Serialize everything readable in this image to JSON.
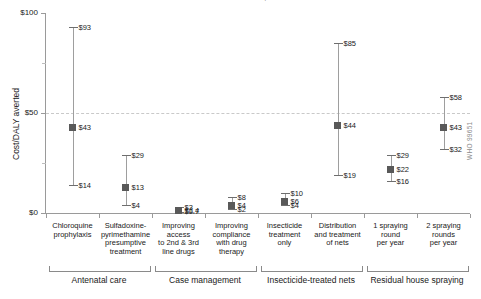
{
  "chart_data": {
    "type": "scatter",
    "title": "Cost-effectiveness of malaria interventions, sub-Saharan Africa",
    "xlabel": "",
    "ylabel": "Cost/DALY averted",
    "ylim": [
      0,
      100
    ],
    "ytick_labels": [
      "$100",
      "$50",
      "$0"
    ],
    "ytick_values": [
      100,
      50,
      0
    ],
    "yminor_values": [
      75,
      25
    ],
    "threshold": {
      "value": 50,
      "style": "dashed"
    },
    "grid": false,
    "legend": "none",
    "source": "WHO 99651",
    "value_prefix": "$",
    "categories": [
      "Chloroquine prophylaxis",
      "Sulfadoxine-pyrimethamine presumptive treatment",
      "Improving access to 2nd & 3rd line drugs",
      "Improving compliance with drug therapy",
      "Insecticide treatment only",
      "Distribution and treatment of nets",
      "1 spraying round per year",
      "2 spraying rounds per year"
    ],
    "category_lines": [
      [
        "Chloroquine",
        "prophylaxis"
      ],
      [
        "Sulfadoxine-",
        "pyrimethamine",
        "presumptive",
        "treatment"
      ],
      [
        "Improving",
        "access",
        "to 2nd & 3rd",
        "line drugs"
      ],
      [
        "Improving",
        "compliance",
        "with drug",
        "therapy"
      ],
      [
        "Insecticide",
        "treatment",
        "only"
      ],
      [
        "Distribution",
        "and treatment",
        "of nets"
      ],
      [
        "1 spraying",
        "round",
        "per year"
      ],
      [
        "2 spraying",
        "rounds",
        "per year"
      ]
    ],
    "points": [
      {
        "category": "Chloroquine prophylaxis",
        "high": 93,
        "value": 43,
        "low": 14,
        "high_label": "$93",
        "value_label": "$43",
        "low_label": "$14"
      },
      {
        "category": "Sulfadoxine-pyrimethamine presumptive treatment",
        "high": 29,
        "value": 13,
        "low": 4,
        "high_label": "$29",
        "value_label": "$13",
        "low_label": "$4"
      },
      {
        "category": "Improving access to 2nd & 3rd line drugs",
        "high": 3,
        "value": 1.4,
        "low": 0.7,
        "high_label": "$3",
        "value_label": "$1.4",
        "low_label": "$0.7"
      },
      {
        "category": "Improving compliance with drug therapy",
        "high": 8,
        "value": 4,
        "low": 2,
        "high_label": "$8",
        "value_label": "$4",
        "low_label": "$2"
      },
      {
        "category": "Insecticide treatment only",
        "high": 10,
        "value": 6,
        "low": 4,
        "high_label": "$10",
        "value_label": "$6",
        "low_label": "$4"
      },
      {
        "category": "Distribution and treatment of nets",
        "high": 85,
        "value": 44,
        "low": 19,
        "high_label": "$85",
        "value_label": "$44",
        "low_label": "$19"
      },
      {
        "category": "1 spraying round per year",
        "high": 29,
        "value": 22,
        "low": 16,
        "high_label": "$29",
        "value_label": "$22",
        "low_label": "$16"
      },
      {
        "category": "2 spraying rounds per year",
        "high": 58,
        "value": 43,
        "low": 32,
        "high_label": "$58",
        "value_label": "$43",
        "low_label": "$32"
      }
    ],
    "groups": [
      {
        "label": "Antenatal care",
        "from": 0,
        "to": 1
      },
      {
        "label": "Case management",
        "from": 2,
        "to": 3
      },
      {
        "label": "Insecticide-treated nets",
        "from": 4,
        "to": 5
      },
      {
        "label": "Residual house spraying",
        "from": 6,
        "to": 7
      }
    ],
    "colors": {
      "marker": "#595959",
      "whisker": "#9e9e9e",
      "cap": "#6e6e6e",
      "axis": "#9a9a9a",
      "threshold": "#c9c9c9",
      "text": "#1a1a1a",
      "source": "#8c8c8c"
    }
  }
}
